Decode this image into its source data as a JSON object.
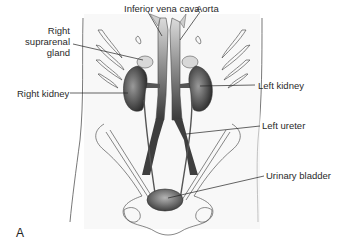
{
  "figure": {
    "panel_letter": "A",
    "labels": {
      "ivc": "Inferior vena cava",
      "aorta": "Aorta",
      "right_suprarenal_line1": "Right",
      "right_suprarenal_line2": "suprarenal",
      "right_suprarenal_line3": "gland",
      "right_kidney": "Right kidney",
      "left_kidney": "Left kidney",
      "left_ureter": "Left ureter",
      "urinary_bladder": "Urinary bladder"
    },
    "colors": {
      "outline": "#3a3a3a",
      "organ_dark": "#4a4a4a",
      "organ_mid": "#8a8a8a",
      "body_fill": "#f2f2f2"
    }
  }
}
